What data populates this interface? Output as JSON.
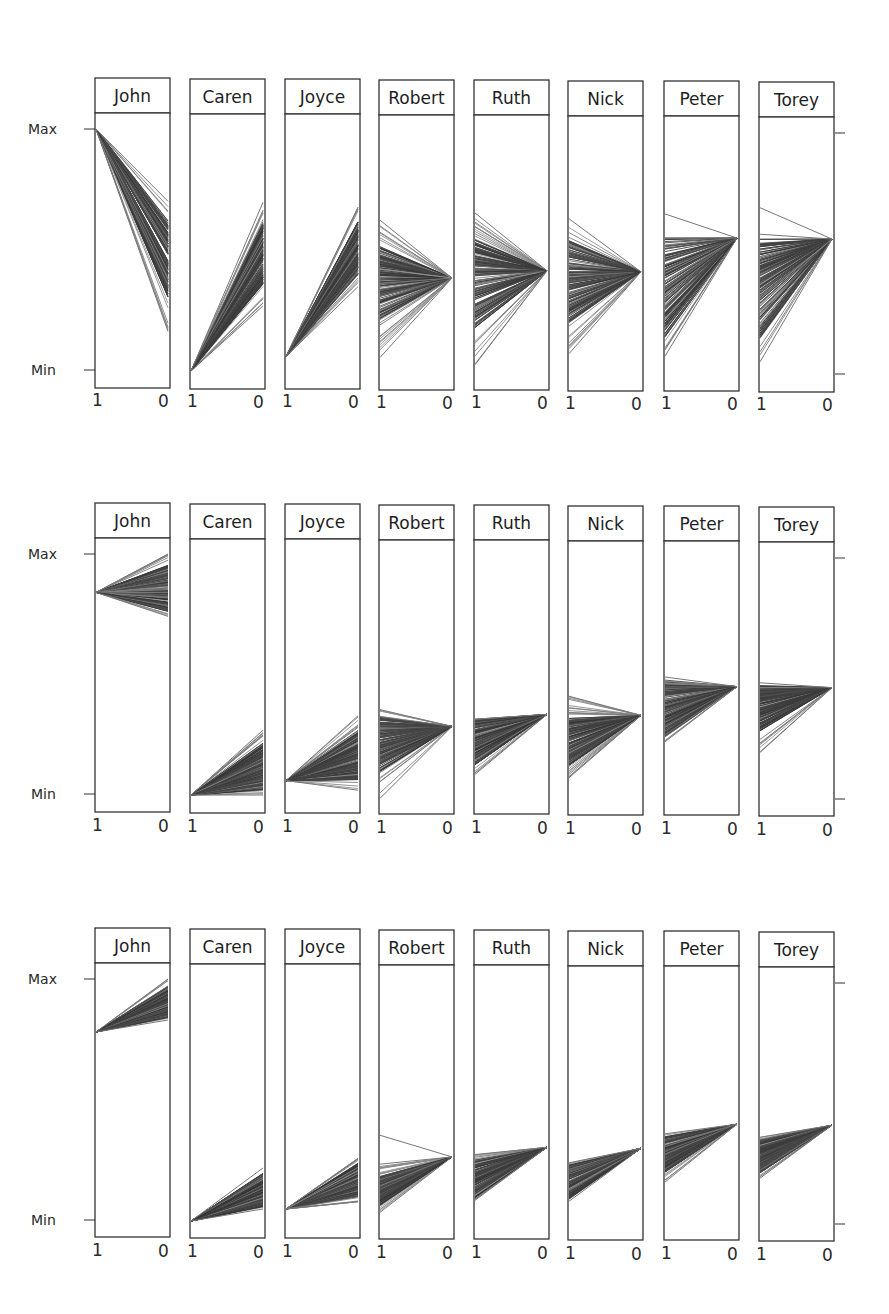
{
  "chart_data": {
    "type": "line",
    "y_axis_labels": {
      "max": "Max",
      "min": "Min"
    },
    "x_tick_labels": [
      "1",
      "0"
    ],
    "line_color": "#3a3a3a",
    "rows": [
      {
        "panels": [
          {
            "name": "John",
            "left": [
              1.0,
              1.0
            ],
            "right": [
              0.16,
              0.7
            ],
            "core_right": [
              0.3,
              0.62
            ],
            "outliers": []
          },
          {
            "name": "Caren",
            "left": [
              0.0,
              0.0
            ],
            "right": [
              0.27,
              0.7
            ],
            "core_right": [
              0.36,
              0.62
            ],
            "outliers": []
          },
          {
            "name": "Joyce",
            "left": [
              0.06,
              0.06
            ],
            "right": [
              0.35,
              0.68
            ],
            "core_right": [
              0.4,
              0.62
            ],
            "outliers": []
          },
          {
            "name": "Robert",
            "left": [
              0.06,
              0.63
            ],
            "right": [
              0.39,
              0.39
            ],
            "core_left": [
              0.22,
              0.52
            ],
            "outliers": []
          },
          {
            "name": "Ruth",
            "left": [
              0.03,
              0.66
            ],
            "right": [
              0.42,
              0.42
            ],
            "core_left": [
              0.18,
              0.55
            ],
            "outliers": []
          },
          {
            "name": "Nick",
            "left": [
              0.08,
              0.64
            ],
            "right": [
              0.42,
              0.42
            ],
            "core_left": [
              0.2,
              0.55
            ],
            "outliers": []
          },
          {
            "name": "Peter",
            "left": [
              0.07,
              0.56
            ],
            "right": [
              0.56,
              0.56
            ],
            "core_left": [
              0.15,
              0.56
            ],
            "outliers": [
              [
                0.66,
                0.56
              ]
            ]
          },
          {
            "name": "Torey",
            "left": [
              0.05,
              0.58
            ],
            "right": [
              0.56,
              0.56
            ],
            "core_left": [
              0.15,
              0.56
            ],
            "outliers": [
              [
                0.69,
                0.56
              ]
            ]
          }
        ]
      },
      {
        "panels": [
          {
            "name": "John",
            "left": [
              0.84,
              0.84
            ],
            "right": [
              0.74,
              1.0
            ],
            "core_right": [
              0.76,
              0.96
            ],
            "outliers": []
          },
          {
            "name": "Caren",
            "left": [
              0.0,
              0.0
            ],
            "right": [
              0.0,
              0.27
            ],
            "core_right": [
              0.02,
              0.22
            ],
            "outliers": []
          },
          {
            "name": "Joyce",
            "left": [
              0.06,
              0.06
            ],
            "right": [
              0.02,
              0.33
            ],
            "core_right": [
              0.06,
              0.27
            ],
            "outliers": []
          },
          {
            "name": "Robert",
            "left": [
              -0.01,
              0.36
            ],
            "right": [
              0.29,
              0.29
            ],
            "core_left": [
              0.1,
              0.33
            ],
            "outliers": []
          },
          {
            "name": "Ruth",
            "left": [
              0.09,
              0.32
            ],
            "right": [
              0.34,
              0.34
            ],
            "core_left": [
              0.13,
              0.32
            ],
            "outliers": []
          },
          {
            "name": "Nick",
            "left": [
              0.08,
              0.42
            ],
            "right": [
              0.34,
              0.34
            ],
            "core_left": [
              0.13,
              0.33
            ],
            "outliers": []
          },
          {
            "name": "Peter",
            "left": [
              0.23,
              0.5
            ],
            "right": [
              0.46,
              0.46
            ],
            "core_left": [
              0.25,
              0.49
            ],
            "outliers": []
          },
          {
            "name": "Torey",
            "left": [
              0.19,
              0.48
            ],
            "right": [
              0.46,
              0.46
            ],
            "core_left": [
              0.28,
              0.47
            ],
            "outliers": []
          }
        ]
      },
      {
        "panels": [
          {
            "name": "John",
            "left": [
              0.78,
              0.78
            ],
            "right": [
              0.83,
              1.0
            ],
            "core_right": [
              0.84,
              0.97
            ],
            "outliers": []
          },
          {
            "name": "Caren",
            "left": [
              0.0,
              0.0
            ],
            "right": [
              0.05,
              0.22
            ],
            "core_right": [
              0.06,
              0.2
            ],
            "outliers": []
          },
          {
            "name": "Joyce",
            "left": [
              0.05,
              0.05
            ],
            "right": [
              0.08,
              0.26
            ],
            "core_right": [
              0.1,
              0.24
            ],
            "outliers": []
          },
          {
            "name": "Robert",
            "left": [
              0.04,
              0.24
            ],
            "right": [
              0.27,
              0.27
            ],
            "core_left": [
              0.07,
              0.19
            ],
            "outliers": [
              [
                0.36,
                0.27
              ]
            ]
          },
          {
            "name": "Ruth",
            "left": [
              0.09,
              0.28
            ],
            "right": [
              0.31,
              0.31
            ],
            "core_left": [
              0.1,
              0.26
            ],
            "outliers": []
          },
          {
            "name": "Nick",
            "left": [
              0.09,
              0.25
            ],
            "right": [
              0.31,
              0.31
            ],
            "core_left": [
              0.1,
              0.24
            ],
            "outliers": []
          },
          {
            "name": "Peter",
            "left": [
              0.17,
              0.37
            ],
            "right": [
              0.41,
              0.41
            ],
            "core_left": [
              0.21,
              0.36
            ],
            "outliers": []
          },
          {
            "name": "Torey",
            "left": [
              0.19,
              0.36
            ],
            "right": [
              0.41,
              0.41
            ],
            "core_left": [
              0.21,
              0.35
            ],
            "outliers": []
          }
        ]
      }
    ]
  }
}
